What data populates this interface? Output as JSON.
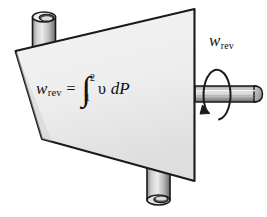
{
  "figure": {
    "name": "reversible-steady-flow-work-device",
    "background_color": "#ffffff"
  },
  "equation": {
    "lhs_variable": "w",
    "lhs_subscript": "rev",
    "equals": "=",
    "integral_symbol": "∫",
    "limit_upper": "2",
    "limit_lower": "1",
    "integrand_variable": "υ",
    "differential": "dP",
    "plain_text": "w_rev = ∫₁² υ dP"
  },
  "shaft_label": {
    "variable": "w",
    "subscript": "rev"
  },
  "colors": {
    "body_fill_light": "#f2f2f2",
    "body_fill_dark": "#dcdcdc",
    "outline": "#1a1a1a",
    "pipe_light": "#e8e8e8",
    "pipe_mid": "#b4b4b4",
    "pipe_dark": "#6e6e6e",
    "shaft_light": "#e4e4e4",
    "shaft_dark": "#7a7a7a",
    "opening_dark": "#3a3a3a",
    "arrow": "#1a1a1a"
  },
  "parts": {
    "body": "device-body",
    "inlet_pipe": "inlet-pipe-top",
    "outlet_pipe": "outlet-pipe-bottom",
    "shaft": "rotating-shaft",
    "rotation_arrow": "rotation-arrow"
  }
}
